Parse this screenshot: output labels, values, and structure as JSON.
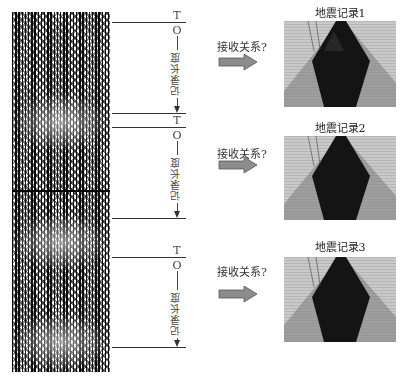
{
  "left_panel": {
    "description": "multi-channel seismic trace section (long continuous recording)",
    "segments": [
      {
        "start_label": "T",
        "origin_label": "O",
        "length_label": "记录长度"
      },
      {
        "start_label": "T",
        "origin_label": "O",
        "length_label": "记录长度"
      },
      {
        "start_label": "T",
        "origin_label": "O",
        "length_label": "记录长度"
      }
    ]
  },
  "relations": [
    {
      "label": "接收关系?",
      "arrow_icon": "right-arrow-icon"
    },
    {
      "label": "接收关系?",
      "arrow_icon": "right-arrow-icon"
    },
    {
      "label": "接收关系?",
      "arrow_icon": "right-arrow-icon"
    }
  ],
  "records": [
    {
      "title": "地震记录1"
    },
    {
      "title": "地震记录2"
    },
    {
      "title": "地震记录3"
    }
  ],
  "colors": {
    "arrow_fill": "#8c8c8c",
    "arrow_stroke": "#555555",
    "line": "#333333",
    "record_bg": "#c9c9c9"
  }
}
